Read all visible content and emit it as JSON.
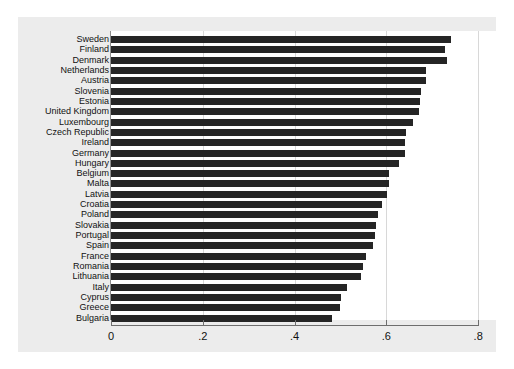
{
  "chart_data": {
    "type": "bar",
    "orientation": "horizontal",
    "title": "",
    "subtitle": "",
    "xlabel": "",
    "ylabel": "",
    "xlim": [
      0,
      0.8
    ],
    "ylim": null,
    "grid": true,
    "legend": null,
    "xticks": [
      "0",
      ".2",
      ".4",
      ".6",
      ".8"
    ],
    "xtick_values": [
      0,
      0.2,
      0.4,
      0.6,
      0.8
    ],
    "categories": [
      "Sweden",
      "Finland",
      "Denmark",
      "Netherlands",
      "Austria",
      "Slovenia",
      "Estonia",
      "United Kingdom",
      "Luxembourg",
      "Czech Republic",
      "Ireland",
      "Germany",
      "Hungary",
      "Belgium",
      "Malta",
      "Latvia",
      "Croatia",
      "Poland",
      "Slovakia",
      "Portugal",
      "Spain",
      "France",
      "Romania",
      "Lithuania",
      "Italy",
      "Cyprus",
      "Greece",
      "Bulgaria"
    ],
    "values": [
      0.741,
      0.728,
      0.732,
      0.687,
      0.686,
      0.675,
      0.673,
      0.671,
      0.658,
      0.643,
      0.641,
      0.64,
      0.627,
      0.606,
      0.605,
      0.601,
      0.59,
      0.582,
      0.577,
      0.575,
      0.571,
      0.556,
      0.549,
      0.545,
      0.514,
      0.501,
      0.498,
      0.481
    ],
    "bar_color": "#252525",
    "panel_color": "#ececec",
    "plot_background": "#ffffff"
  }
}
